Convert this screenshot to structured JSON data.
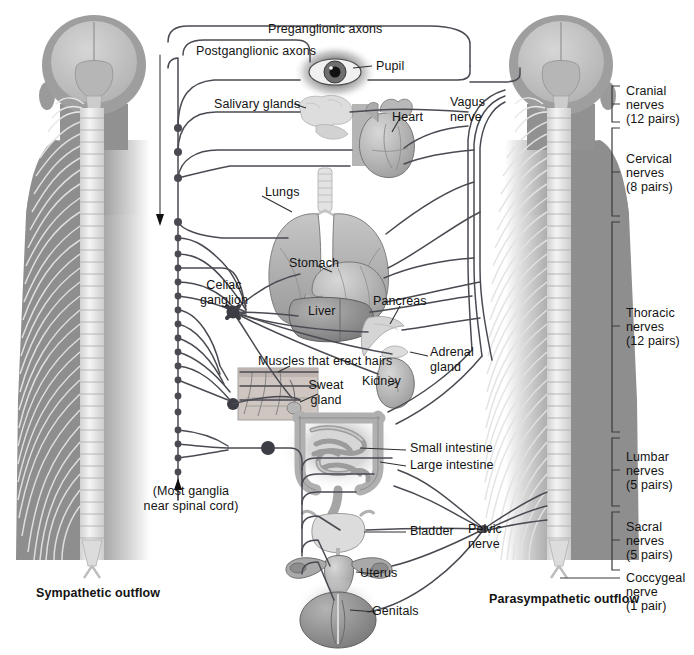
{
  "figure": {
    "type": "anatomical-diagram"
  },
  "legend": {
    "preganglionic": "Preganglionic axons",
    "postganglionic": "Postganglionic axons"
  },
  "outflow": {
    "left": "Sympathetic outflow",
    "right": "Parasympathetic outflow"
  },
  "nerves": {
    "vagus": "Vagus\nnerve",
    "pelvic": "Pelvic\nnerve"
  },
  "ganglia": {
    "celiac": "Celiac\nganglion",
    "note": "(Most ganglia\nnear spinal cord)"
  },
  "organs": [
    {
      "name": "pupil",
      "label": "Pupil"
    },
    {
      "name": "salivary-glands",
      "label": "Salivary glands"
    },
    {
      "name": "heart",
      "label": "Heart"
    },
    {
      "name": "lungs",
      "label": "Lungs"
    },
    {
      "name": "stomach",
      "label": "Stomach"
    },
    {
      "name": "liver",
      "label": "Liver"
    },
    {
      "name": "pancreas",
      "label": "Pancreas"
    },
    {
      "name": "erector-muscles",
      "label": "Muscles that erect hairs"
    },
    {
      "name": "sweat-gland",
      "label": "Sweat\ngland"
    },
    {
      "name": "kidney",
      "label": "Kidney"
    },
    {
      "name": "adrenal-gland",
      "label": "Adrenal\ngland"
    },
    {
      "name": "small-intestine",
      "label": "Small intestine"
    },
    {
      "name": "large-intestine",
      "label": "Large intestine"
    },
    {
      "name": "bladder",
      "label": "Bladder"
    },
    {
      "name": "uterus",
      "label": "Uterus"
    },
    {
      "name": "genitals",
      "label": "Genitals"
    }
  ],
  "spinal_regions": [
    {
      "name": "cranial",
      "line1": "Cranial",
      "line2": "nerves",
      "line3": "(12 pairs)"
    },
    {
      "name": "cervical",
      "line1": "Cervical",
      "line2": "nerves",
      "line3": "(8 pairs)"
    },
    {
      "name": "thoracic",
      "line1": "Thoracic",
      "line2": "nerves",
      "line3": "(12 pairs)"
    },
    {
      "name": "lumbar",
      "line1": "Lumbar",
      "line2": "nerves",
      "line3": "(5 pairs)"
    },
    {
      "name": "sacral",
      "line1": "Sacral",
      "line2": "nerves",
      "line3": "(5 pairs)"
    },
    {
      "name": "coccygeal",
      "line1": "Coccygeal",
      "line2": "nerve",
      "line3": "(1 pair)"
    }
  ],
  "colors": {
    "background": "#ffffff",
    "body_silhouette": "#8e8e8e",
    "body_silhouette_light": "#c9c9c9",
    "skull": "#9a9a9a",
    "brain": "#bdbdbd",
    "spinal_cord": "#e6e6e6",
    "vertebra": "#f0f0f0",
    "nerve_line": "#4a4a52",
    "organ_mid": "#a8a8a8",
    "organ_light": "#cfcfcf",
    "organ_dark": "#7d7d7d",
    "text": "#131313",
    "bracket": "#3a3a3a"
  }
}
